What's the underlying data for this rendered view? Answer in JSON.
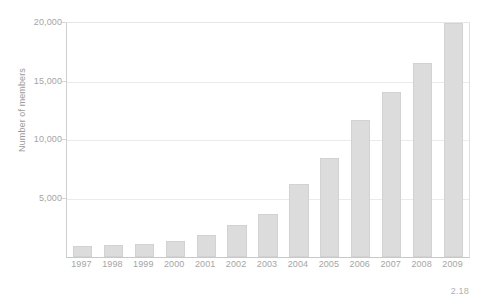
{
  "chart_data": {
    "type": "bar",
    "title": "",
    "subtitle": "",
    "xlabel": "",
    "ylabel": "Number of members",
    "categories": [
      "1997",
      "1998",
      "1999",
      "2000",
      "2001",
      "2002",
      "2003",
      "2004",
      "2005",
      "2006",
      "2007",
      "2008",
      "2009"
    ],
    "values": [
      900,
      1000,
      1100,
      1400,
      1900,
      2700,
      3700,
      6200,
      8500,
      11700,
      14100,
      16600,
      20000
    ],
    "ylim": [
      0,
      20000
    ],
    "yticks": [
      5000,
      10000,
      15000,
      20000
    ],
    "ytick_labels": [
      "5,000",
      "10,000",
      "15,000",
      "20,000"
    ],
    "grid": true,
    "legend": false,
    "legend_position": "none",
    "bar_color": "#dcdcdc",
    "bar_border_color": "#d2d2d2",
    "axis_color": "#c8c8c8",
    "gridline_color": "#ebebeb",
    "text_color": "#a5a5a5",
    "annotations": [
      "2.18"
    ]
  },
  "axis": {
    "y_title": "Number of members"
  },
  "footnote": {
    "text": "2.18"
  }
}
